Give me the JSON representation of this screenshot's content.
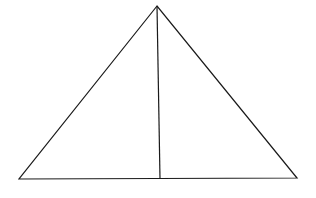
{
  "diagram": {
    "width": 316,
    "height": 198,
    "background": "#ffffff",
    "stroke_color": "#1a1a1a",
    "stroke_width": 1.2,
    "triangle": {
      "apex": [
        157,
        6
      ],
      "bottom_left": [
        19,
        179
      ],
      "bottom_right": [
        297,
        178
      ]
    },
    "altitude": {
      "from": [
        157,
        6
      ],
      "to": [
        160,
        179
      ]
    },
    "labels": []
  }
}
